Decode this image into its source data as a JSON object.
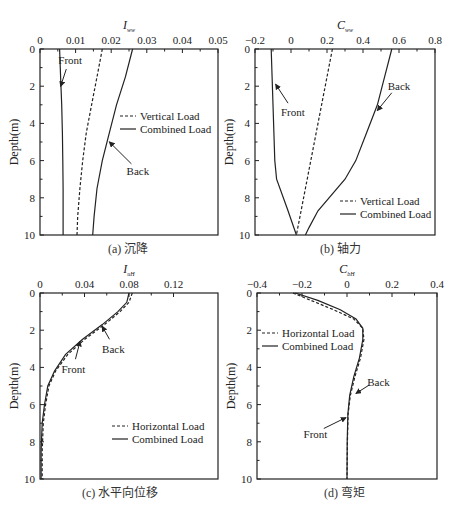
{
  "figure_caption": "",
  "chart_data": [
    {
      "id": "a",
      "type": "line",
      "caption": "(a) 沉降",
      "title": "",
      "xlabel": "I",
      "xlabel_sub": "ww",
      "ylabel": "Depth(m)",
      "xlim": [
        0,
        0.05
      ],
      "ylim": [
        0,
        10
      ],
      "y_inverted": true,
      "x_axis_position": "top",
      "xticks": [
        0,
        0.01,
        0.02,
        0.03,
        0.04,
        0.05
      ],
      "xtick_labels": [
        "0",
        "0.01",
        "0.02",
        "0.03",
        "0.04",
        "0.05"
      ],
      "yticks": [
        0,
        2,
        4,
        6,
        8,
        10
      ],
      "ytick_labels": [
        "0",
        "2",
        "4",
        "6",
        "8",
        "10"
      ],
      "box": {
        "x0": 40,
        "x1": 218,
        "y0": 49,
        "y1": 235
      },
      "legend": {
        "position": "center-right",
        "x": 120,
        "y": 120,
        "entries": [
          {
            "label": "Vertical Load",
            "style": "dashed"
          },
          {
            "label": "Combined Load",
            "style": "solid"
          }
        ]
      },
      "series": [
        {
          "name": "Vertical Load",
          "style": "dashed",
          "x": [
            0.0175,
            0.016,
            0.0145,
            0.013,
            0.012,
            0.0112,
            0.0106,
            0.0104
          ],
          "y": [
            0,
            1.5,
            3,
            4.5,
            6,
            7.5,
            9,
            10
          ]
        },
        {
          "name": "Combined Load (Back)",
          "style": "solid",
          "x": [
            0.026,
            0.024,
            0.0215,
            0.0195,
            0.0175,
            0.016,
            0.0152,
            0.0148
          ],
          "y": [
            0,
            1.5,
            3,
            4.5,
            6,
            7.5,
            9,
            10
          ]
        },
        {
          "name": "Combined Load (Front)",
          "style": "solid",
          "x": [
            0.0055,
            0.0058,
            0.0061,
            0.0063,
            0.0064,
            0.0065,
            0.0065,
            0.0065
          ],
          "y": [
            0,
            1.5,
            3,
            4.5,
            6,
            7.5,
            9,
            10
          ]
        }
      ],
      "annotations": [
        {
          "text": "Front",
          "tx": 0.0085,
          "ty": 0.8,
          "ax": 0.0058,
          "ay": 2.0
        },
        {
          "text": "Back",
          "tx": 0.0275,
          "ty": 6.8,
          "ax": 0.0195,
          "ay": 5.0
        }
      ]
    },
    {
      "id": "b",
      "type": "line",
      "caption": "(b) 轴力",
      "title": "",
      "xlabel": "C",
      "xlabel_sub": "ww",
      "ylabel": "Depth(m)",
      "xlim": [
        -0.2,
        0.8
      ],
      "ylim": [
        0,
        10
      ],
      "y_inverted": true,
      "x_axis_position": "top",
      "xticks": [
        -0.2,
        0,
        0.2,
        0.4,
        0.6,
        0.8
      ],
      "xtick_labels": [
        "−0.2",
        "0",
        "0.2",
        "0.4",
        "0.6",
        "0.8"
      ],
      "yticks": [
        0,
        2,
        4,
        6,
        8,
        10
      ],
      "ytick_labels": [
        "0",
        "2",
        "4",
        "6",
        "8",
        "10"
      ],
      "box": {
        "x0": 255,
        "x1": 435,
        "y0": 49,
        "y1": 235
      },
      "legend": {
        "position": "lower-right",
        "x": 340,
        "y": 205,
        "entries": [
          {
            "label": "Vertical Load",
            "style": "dashed"
          },
          {
            "label": "Combined Load",
            "style": "solid"
          }
        ]
      },
      "series": [
        {
          "name": "Vertical Load",
          "style": "dashed",
          "x": [
            0.23,
            0.2,
            0.17,
            0.14,
            0.11,
            0.08,
            0.05,
            0.03
          ],
          "y": [
            0,
            1.5,
            3,
            4.5,
            6,
            7.5,
            9,
            10
          ]
        },
        {
          "name": "Combined Load (Back)",
          "style": "solid",
          "x": [
            0.56,
            0.52,
            0.48,
            0.42,
            0.36,
            0.3,
            0.15,
            0.1,
            0.08
          ],
          "y": [
            0,
            1.5,
            3,
            4.5,
            6,
            7,
            8.7,
            9.6,
            10
          ]
        },
        {
          "name": "Combined Load (Front)",
          "style": "solid",
          "x": [
            -0.11,
            -0.105,
            -0.1,
            -0.095,
            -0.09,
            -0.08,
            -0.02,
            0.03
          ],
          "y": [
            0,
            1.5,
            3,
            4.5,
            6,
            7,
            8.6,
            10
          ]
        }
      ],
      "annotations": [
        {
          "text": "Front",
          "tx": 0.01,
          "ty": 3.6,
          "ax": -0.085,
          "ay": 1.9
        },
        {
          "text": "Back",
          "tx": 0.6,
          "ty": 2.2,
          "ax": 0.48,
          "ay": 3.3
        }
      ]
    },
    {
      "id": "c",
      "type": "line",
      "caption": "(c) 水平向位移",
      "title": "",
      "xlabel": "I",
      "xlabel_sub": "uH",
      "ylabel": "Depth(m)",
      "xlim": [
        0,
        0.16
      ],
      "ylim": [
        0,
        10
      ],
      "y_inverted": true,
      "x_axis_position": "top",
      "xticks": [
        0,
        0.04,
        0.08,
        0.12
      ],
      "xtick_labels": [
        "0",
        "0.04",
        "0.08",
        "0.12"
      ],
      "yticks": [
        0,
        2,
        4,
        6,
        8,
        10
      ],
      "ytick_labels": [
        "0",
        "2",
        "4",
        "6",
        "8",
        "10"
      ],
      "box": {
        "x0": 40,
        "x1": 218,
        "y0": 293,
        "y1": 479
      },
      "legend": {
        "position": "lower-right",
        "x": 112,
        "y": 430,
        "entries": [
          {
            "label": "Horizontal Load",
            "style": "dashed"
          },
          {
            "label": "Combined Load",
            "style": "solid"
          }
        ]
      },
      "series": [
        {
          "name": "Horizontal Load",
          "style": "dashed",
          "x": [
            0.083,
            0.08,
            0.072,
            0.058,
            0.04,
            0.025,
            0.014,
            0.008,
            0.005,
            0.003,
            0.002,
            0.002
          ],
          "y": [
            0,
            0.5,
            1.0,
            1.7,
            2.5,
            3.3,
            4.2,
            5.0,
            6.0,
            7.0,
            8.5,
            10
          ]
        },
        {
          "name": "Combined Load",
          "style": "solid",
          "x": [
            0.08,
            0.078,
            0.07,
            0.056,
            0.038,
            0.023,
            0.013,
            0.007,
            0.004,
            0.002,
            0.001,
            0.001
          ],
          "y": [
            0,
            0.5,
            1.0,
            1.7,
            2.5,
            3.3,
            4.2,
            5.0,
            6.0,
            7.0,
            8.5,
            10
          ]
        }
      ],
      "annotations": [
        {
          "text": "Front",
          "tx": 0.03,
          "ty": 4.3,
          "ax": 0.036,
          "ay": 2.6
        },
        {
          "text": "Back",
          "tx": 0.066,
          "ty": 3.2,
          "ax": 0.056,
          "ay": 1.8
        }
      ]
    },
    {
      "id": "d",
      "type": "line",
      "caption": "(d) 弯矩",
      "title": "",
      "xlabel": "C",
      "xlabel_sub": "bH",
      "ylabel": "Depth(m)",
      "xlim": [
        -0.4,
        0.4
      ],
      "ylim": [
        0,
        10
      ],
      "y_inverted": true,
      "x_axis_position": "top",
      "xticks": [
        -0.4,
        -0.2,
        0,
        0.2,
        0.4
      ],
      "xtick_labels": [
        "−0.4",
        "−0.2",
        "0",
        "0.2",
        "0.4"
      ],
      "yticks": [
        0,
        2,
        4,
        6,
        8,
        10
      ],
      "ytick_labels": [
        "0",
        "2",
        "4",
        "6",
        "8",
        "10"
      ],
      "box": {
        "x0": 257,
        "x1": 437,
        "y0": 293,
        "y1": 479
      },
      "legend": {
        "position": "upper-left",
        "x": 262,
        "y": 337,
        "entries": [
          {
            "label": "Horizontal Load",
            "style": "dashed"
          },
          {
            "label": "Combined Load",
            "style": "solid"
          }
        ]
      },
      "series": [
        {
          "name": "Horizontal Load",
          "style": "dashed",
          "x": [
            -0.24,
            -0.16,
            -0.06,
            0.03,
            0.07,
            0.075,
            0.06,
            0.035,
            0.015,
            0.005,
            0.002,
            0.0
          ],
          "y": [
            0,
            0.4,
            0.9,
            1.4,
            1.9,
            2.5,
            3.5,
            4.5,
            5.5,
            6.5,
            8,
            10
          ]
        },
        {
          "name": "Combined Load",
          "style": "solid",
          "x": [
            -0.23,
            -0.13,
            -0.03,
            0.04,
            0.07,
            0.07,
            0.055,
            0.03,
            0.012,
            0.004,
            0.001,
            0.0
          ],
          "y": [
            0,
            0.4,
            0.9,
            1.4,
            1.9,
            2.5,
            3.5,
            4.5,
            5.5,
            6.5,
            8,
            10
          ]
        }
      ],
      "annotations": [
        {
          "text": "Front",
          "tx": -0.14,
          "ty": 7.8,
          "ax": -0.005,
          "ay": 6.7
        },
        {
          "text": "Back",
          "tx": 0.14,
          "ty": 5.0,
          "ax": 0.04,
          "ay": 5.4
        }
      ]
    }
  ]
}
